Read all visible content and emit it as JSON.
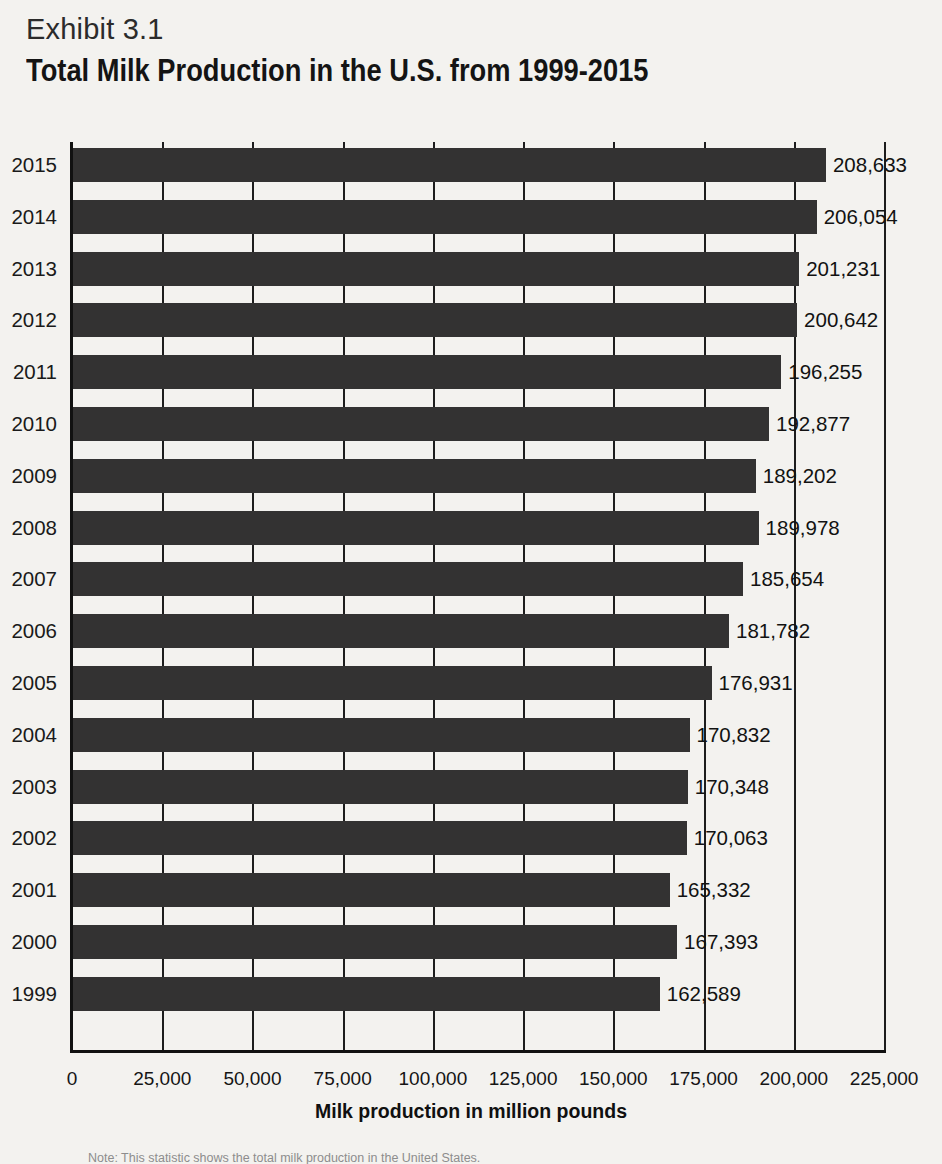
{
  "header": {
    "exhibit_label": "Exhibit 3.1",
    "title": "Total Milk Production in the U.S. from 1999-2015"
  },
  "axis_title": "Milk production in million pounds",
  "note": "Note: This statistic shows the total milk production in the United States.",
  "colors": {
    "background": "#f3f2ef",
    "bar": "#333232",
    "axis": "#111111",
    "gridline": "#1d1d1d",
    "text": "#151515"
  },
  "chart_data": {
    "type": "bar",
    "orientation": "horizontal",
    "title": "Total Milk Production in the U.S. from 1999-2015",
    "subtitle": "Exhibit 3.1",
    "xlabel": "Milk production in million pounds",
    "ylabel": "",
    "xlim": [
      0,
      225000
    ],
    "xtick_step": 25000,
    "grid": true,
    "legend": null,
    "categories": [
      "2015",
      "2014",
      "2013",
      "2012",
      "2011",
      "2010",
      "2009",
      "2008",
      "2007",
      "2006",
      "2005",
      "2004",
      "2003",
      "2002",
      "2001",
      "2000",
      "1999"
    ],
    "values": [
      208633,
      206054,
      201231,
      200642,
      196255,
      192877,
      189202,
      189978,
      185654,
      181782,
      176931,
      170832,
      170348,
      170063,
      165332,
      167393,
      162589
    ],
    "value_labels": [
      "208,633",
      "206,054",
      "201,231",
      "200,642",
      "196,255",
      "192,877",
      "189,202",
      "189,978",
      "185,654",
      "181,782",
      "176,931",
      "170,832",
      "170,348",
      "170,063",
      "165,332",
      "167,393",
      "162,589"
    ],
    "xtick_labels": [
      "0",
      "25,000",
      "50,000",
      "75,000",
      "100,000",
      "125,000",
      "150,000",
      "175,000",
      "200,000",
      "225,000"
    ],
    "xtick_values": [
      0,
      25000,
      50000,
      75000,
      100000,
      125000,
      150000,
      175000,
      200000,
      225000
    ]
  }
}
